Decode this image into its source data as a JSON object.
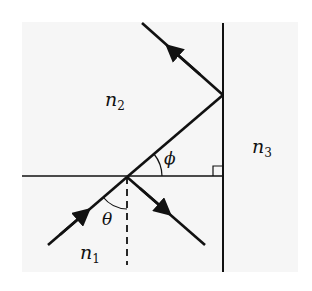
{
  "diagram": {
    "type": "ray-optics",
    "media": {
      "n1": {
        "base": "n",
        "sub": "1"
      },
      "n2": {
        "base": "n",
        "sub": "2"
      },
      "n3": {
        "base": "n",
        "sub": "3"
      }
    },
    "angles": {
      "theta": "θ",
      "phi": "ϕ"
    },
    "elements": [
      "horizontal interface between n1 and n2",
      "vertical interface between n2 and n3",
      "incident ray in n1 with arrow",
      "reflected ray in n1 with arrow",
      "refracted ray in n2 at angle phi to horizontal",
      "ray totally reflected at vertical interface with arrow",
      "dashed normal line below interface",
      "right-angle marker between interfaces"
    ],
    "colors": {
      "line": "#111111",
      "background": "#f6f6f6"
    }
  }
}
